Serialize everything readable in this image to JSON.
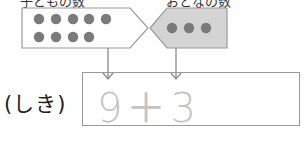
{
  "labels": {
    "left_group": "子どもの数",
    "right_group": "おとなの数",
    "expression_label": "(しき)"
  },
  "groups": {
    "left": {
      "count": 9,
      "rows": [
        5,
        4
      ],
      "fill": "#ffffff",
      "dot_color": "#7a7a7a"
    },
    "right": {
      "count": 3,
      "rows": [
        3
      ],
      "fill": "#d4d4d4",
      "dot_color": "#7a7a7a"
    }
  },
  "equation": {
    "text": "9＋3",
    "text_color": "#c4c4c4"
  },
  "colors": {
    "outline": "#9a9a9a",
    "arrow": "#8a8a8a"
  }
}
